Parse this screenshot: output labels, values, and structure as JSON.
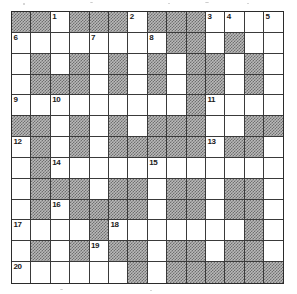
{
  "puzzle": {
    "type": "crossword-grid",
    "columns": 14,
    "rows": 13,
    "cell_size_px": 19.4,
    "colors": {
      "blocked_fill": "#b9b9b9",
      "blocked_pattern": "#6f6f6f",
      "open_fill": "#ffffff",
      "grid_line": "#3a3a3a",
      "outer_border": "#2b2b2b",
      "number_text": "#1a1a1a"
    },
    "legend": {
      "blocked": "shaded/hatched square (no letter entered)",
      "open": "white square (letter square)"
    },
    "clue_numbers_total": 20,
    "clue_numbers": [
      {
        "number": "1",
        "row": 1,
        "col": 3
      },
      {
        "number": "2",
        "row": 1,
        "col": 7
      },
      {
        "number": "3",
        "row": 1,
        "col": 11
      },
      {
        "number": "4",
        "row": 1,
        "col": 12
      },
      {
        "number": "5",
        "row": 1,
        "col": 14
      },
      {
        "number": "6",
        "row": 2,
        "col": 1
      },
      {
        "number": "7",
        "row": 2,
        "col": 5
      },
      {
        "number": "8",
        "row": 2,
        "col": 8
      },
      {
        "number": "9",
        "row": 5,
        "col": 1
      },
      {
        "number": "10",
        "row": 5,
        "col": 3
      },
      {
        "number": "11",
        "row": 5,
        "col": 11
      },
      {
        "number": "12",
        "row": 7,
        "col": 1
      },
      {
        "number": "13",
        "row": 7,
        "col": 11
      },
      {
        "number": "14",
        "row": 8,
        "col": 3
      },
      {
        "number": "15",
        "row": 8,
        "col": 8
      },
      {
        "number": "16",
        "row": 10,
        "col": 3
      },
      {
        "number": "17",
        "row": 11,
        "col": 1
      },
      {
        "number": "18",
        "row": 11,
        "col": 6
      },
      {
        "number": "19",
        "row": 12,
        "col": 5
      },
      {
        "number": "20",
        "row": 13,
        "col": 1
      }
    ],
    "grid": [
      [
        "B",
        "B",
        "O",
        "B",
        "B",
        "B",
        "O",
        "B",
        "B",
        "B",
        "O",
        "O",
        "O",
        "O"
      ],
      [
        "O",
        "O",
        "O",
        "O",
        "O",
        "O",
        "O",
        "O",
        "B",
        "B",
        "O",
        "B",
        "O",
        "O"
      ],
      [
        "O",
        "B",
        "O",
        "B",
        "O",
        "B",
        "O",
        "B",
        "O",
        "B",
        "B",
        "O",
        "B",
        "O"
      ],
      [
        "O",
        "B",
        "B",
        "B",
        "O",
        "B",
        "O",
        "B",
        "O",
        "B",
        "B",
        "O",
        "B",
        "O"
      ],
      [
        "O",
        "O",
        "O",
        "O",
        "O",
        "O",
        "O",
        "O",
        "O",
        "B",
        "O",
        "O",
        "O",
        "O"
      ],
      [
        "B",
        "B",
        "O",
        "B",
        "O",
        "B",
        "O",
        "B",
        "B",
        "B",
        "O",
        "O",
        "B",
        "B"
      ],
      [
        "O",
        "B",
        "O",
        "B",
        "O",
        "B",
        "B",
        "B",
        "B",
        "B",
        "O",
        "B",
        "B",
        "O"
      ],
      [
        "O",
        "B",
        "O",
        "O",
        "O",
        "O",
        "O",
        "O",
        "O",
        "O",
        "O",
        "O",
        "O",
        "O"
      ],
      [
        "O",
        "B",
        "B",
        "B",
        "O",
        "B",
        "B",
        "O",
        "B",
        "B",
        "O",
        "B",
        "B",
        "O"
      ],
      [
        "O",
        "B",
        "O",
        "B",
        "B",
        "B",
        "B",
        "O",
        "B",
        "B",
        "O",
        "B",
        "B",
        "O"
      ],
      [
        "O",
        "O",
        "O",
        "O",
        "B",
        "O",
        "O",
        "O",
        "O",
        "O",
        "O",
        "O",
        "B",
        "O"
      ],
      [
        "O",
        "B",
        "O",
        "B",
        "O",
        "B",
        "B",
        "O",
        "B",
        "B",
        "O",
        "B",
        "B",
        "O"
      ],
      [
        "O",
        "O",
        "O",
        "O",
        "O",
        "O",
        "B",
        "O",
        "B",
        "B",
        "B",
        "B",
        "B",
        "B"
      ]
    ]
  }
}
